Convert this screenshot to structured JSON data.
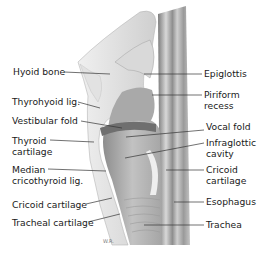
{
  "diagram": {
    "colors": {
      "background": "#ffffff",
      "text": "#1a1a1a",
      "leader": "#333333",
      "tissue_light": "#e6e6e6",
      "tissue_mid": "#bdbdbd",
      "tissue_dark": "#8a8a8a"
    },
    "labels_left": [
      {
        "id": "hyoid-bone",
        "text": "Hyoid bone"
      },
      {
        "id": "thyrohyoid-lig",
        "text": "Thyrohyoid lig."
      },
      {
        "id": "vestibular-fold",
        "text": "Vestibular fold"
      },
      {
        "id": "thyroid-cartilage",
        "line1": "Thyroid",
        "line2": "cartilage"
      },
      {
        "id": "median-cricothyroid-lig",
        "line1": "Median",
        "line2": "cricothyroid lig."
      },
      {
        "id": "cricoid-cartilage-left",
        "text": "Cricoid cartilage"
      },
      {
        "id": "tracheal-cartilage",
        "text": "Tracheal cartilage"
      }
    ],
    "labels_right": [
      {
        "id": "epiglottis",
        "text": "Epiglottis"
      },
      {
        "id": "piriform-recess",
        "line1": "Piriform",
        "line2": "recess"
      },
      {
        "id": "vocal-fold",
        "text": "Vocal fold"
      },
      {
        "id": "infraglottic-cavity",
        "line1": "Infraglottic",
        "line2": "cavity"
      },
      {
        "id": "cricoid-cartilage-right",
        "line1": "Cricoid",
        "line2": "cartilage"
      },
      {
        "id": "esophagus",
        "text": "Esophagus"
      },
      {
        "id": "trachea",
        "text": "Trachea"
      }
    ],
    "signature": "W.R."
  }
}
